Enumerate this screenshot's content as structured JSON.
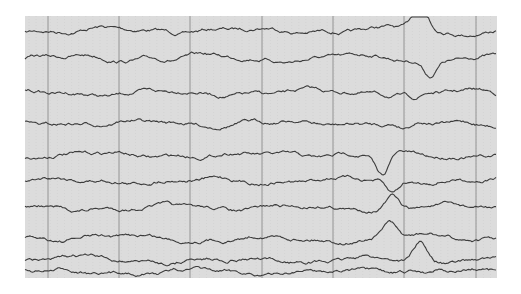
{
  "figure": {
    "kind": "eeg-trace",
    "paper": {
      "x": 25,
      "y": 16,
      "width": 472,
      "height": 262,
      "color": "#dcdcdc"
    },
    "gridline_color": "#8a8a8a",
    "trace_color": "#3c3c3c",
    "major_lines_x": [
      48,
      119,
      190,
      262,
      333,
      404,
      476
    ],
    "channel_count": 10,
    "channels": [
      {
        "y": 30,
        "event": {
          "x": 420,
          "amp": -30
        }
      },
      {
        "y": 58,
        "event": {
          "x": 430,
          "amp": 16
        }
      },
      {
        "y": 93,
        "event": {
          "x": 415,
          "amp": 5
        }
      },
      {
        "y": 123,
        "event": {
          "x": 405,
          "amp": 6
        }
      },
      {
        "y": 155,
        "event": {
          "x": 382,
          "amp": 22
        }
      },
      {
        "y": 180,
        "event": {
          "x": 392,
          "amp": 14
        }
      },
      {
        "y": 208,
        "event": {
          "x": 392,
          "amp": -13
        }
      },
      {
        "y": 238,
        "event": {
          "x": 389,
          "amp": -15
        }
      },
      {
        "y": 260,
        "event": {
          "x": 420,
          "amp": -18
        }
      },
      {
        "y": 272,
        "event": {
          "x": 440,
          "amp": -6
        }
      }
    ]
  }
}
